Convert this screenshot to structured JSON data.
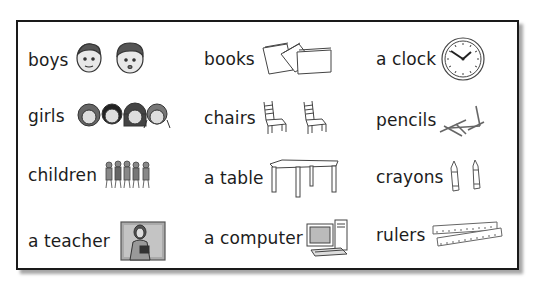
{
  "vocabulary": {
    "columns": [
      {
        "items": [
          {
            "label": "boys",
            "icon": "boys-icon"
          },
          {
            "label": "girls",
            "icon": "girls-icon"
          },
          {
            "label": "children",
            "icon": "children-icon"
          },
          {
            "label": "a teacher",
            "icon": "teacher-icon"
          }
        ]
      },
      {
        "items": [
          {
            "label": "books",
            "icon": "books-icon"
          },
          {
            "label": "chairs",
            "icon": "chairs-icon"
          },
          {
            "label": "a table",
            "icon": "table-icon"
          },
          {
            "label": "a computer",
            "icon": "computer-icon"
          }
        ]
      },
      {
        "items": [
          {
            "label": "a clock",
            "icon": "clock-icon"
          },
          {
            "label": "pencils",
            "icon": "pencils-icon"
          },
          {
            "label": "crayons",
            "icon": "crayons-icon"
          },
          {
            "label": "rulers",
            "icon": "rulers-icon"
          }
        ]
      }
    ]
  }
}
